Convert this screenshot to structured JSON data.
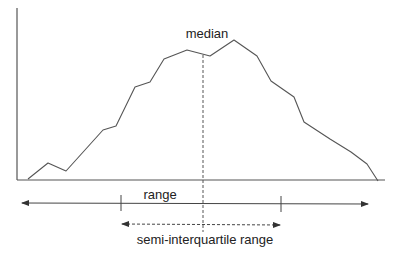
{
  "diagram": {
    "labels": {
      "median": "median",
      "range": "range",
      "siqr": "semi-interquartile range"
    },
    "colors": {
      "line": "#555555",
      "text": "#222222",
      "background": "#ffffff"
    },
    "axes": {
      "y_axis": {
        "x": 17,
        "y_top": 8,
        "y_bottom": 180
      },
      "x_axis": {
        "y": 180,
        "x_left": 17,
        "x_right": 385
      }
    },
    "curve_points": [
      [
        28,
        179
      ],
      [
        48,
        163
      ],
      [
        66,
        171
      ],
      [
        103,
        130
      ],
      [
        116,
        126
      ],
      [
        135,
        87
      ],
      [
        150,
        82
      ],
      [
        164,
        59
      ],
      [
        187,
        50
      ],
      [
        210,
        56
      ],
      [
        234,
        40
      ],
      [
        257,
        56
      ],
      [
        271,
        81
      ],
      [
        294,
        97
      ],
      [
        304,
        122
      ],
      [
        330,
        139
      ],
      [
        351,
        152
      ],
      [
        367,
        164
      ],
      [
        378,
        181
      ]
    ],
    "median_line": {
      "x": 203,
      "y_top": 55,
      "y_bottom": 232,
      "style": "dashed"
    },
    "range_arrow": {
      "y": 203,
      "x_left": 22,
      "x_right": 368,
      "ticks_x": [
        121,
        281
      ],
      "style": "solid",
      "double_headed": true
    },
    "siqr_arrow": {
      "y": 225,
      "x_left": 120,
      "x_right": 282,
      "style": "dashed",
      "double_headed": true
    }
  }
}
